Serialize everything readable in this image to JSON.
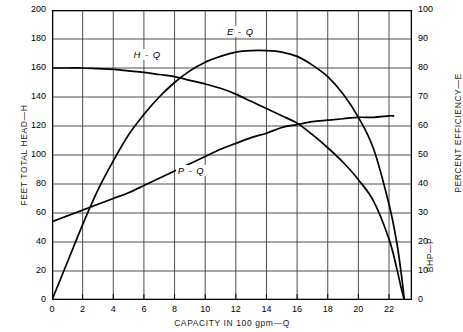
{
  "chart_data": {
    "type": "line",
    "title": "",
    "xlabel": "CAPACITY IN 100 gpm—Q",
    "ylabel_left": "FEET TOTAL HEAD—H",
    "ylabel_right_top": "PERCENT EFFICIENCY—E",
    "ylabel_right_bottom": "BHP—P",
    "xlim": [
      0,
      23.5
    ],
    "ylim_left": [
      0,
      200
    ],
    "ylim_right": [
      0,
      100
    ],
    "grid": true,
    "legend": "inline-curve-labels",
    "x_ticks": [
      0,
      2,
      4,
      6,
      8,
      10,
      12,
      14,
      16,
      18,
      20,
      22
    ],
    "y_ticks_left": [
      0,
      20,
      40,
      60,
      80,
      100,
      120,
      140,
      160,
      180,
      200
    ],
    "y_ticks_right": [
      0,
      10,
      20,
      30,
      40,
      50,
      60,
      70,
      80,
      90,
      100
    ],
    "series": [
      {
        "name": "H - Q",
        "label": "H - Q",
        "axis": "left",
        "units": "feet total head",
        "x": [
          0,
          1,
          2,
          3,
          4,
          5,
          6,
          7,
          8,
          9,
          10,
          11,
          12,
          13,
          14,
          15,
          16,
          17,
          18,
          19,
          20,
          21,
          22,
          22.5,
          22.8,
          23
        ],
        "values": [
          160,
          160,
          160,
          159.5,
          159,
          158,
          157,
          155.5,
          154,
          151.5,
          149,
          146,
          142,
          137,
          132,
          127,
          122,
          114,
          105,
          95,
          83,
          68,
          42,
          22,
          8,
          0
        ]
      },
      {
        "name": "E - Q",
        "label": "E - Q",
        "axis": "right",
        "units": "percent efficiency",
        "x": [
          0,
          1,
          2,
          3,
          4,
          5,
          6,
          7,
          8,
          9,
          10,
          11,
          12,
          13,
          14,
          15,
          16,
          17,
          18,
          19,
          20,
          21,
          22,
          22.5,
          22.8,
          23
        ],
        "values": [
          0,
          13,
          26,
          38,
          48,
          57,
          64,
          70,
          75,
          79,
          82,
          84,
          85.5,
          86,
          86,
          85.5,
          84,
          81,
          77,
          71,
          63,
          52,
          33,
          20,
          9,
          0
        ]
      },
      {
        "name": "P - Q",
        "label": "P - Q",
        "axis": "right",
        "units": "brake horsepower",
        "x": [
          0,
          1,
          2,
          3,
          4,
          5,
          6,
          7,
          8,
          9,
          10,
          11,
          12,
          13,
          14,
          15,
          16,
          17,
          18,
          19,
          20,
          21,
          22,
          22.3
        ],
        "values": [
          27,
          29,
          31,
          33,
          35,
          37,
          39.5,
          42,
          44.5,
          47,
          49.5,
          52,
          54,
          56,
          57.5,
          59.5,
          60.5,
          61.5,
          62,
          62.5,
          63,
          63,
          63.5,
          63.5
        ]
      }
    ],
    "annotations": [
      {
        "text": "H - Q",
        "x": 6.1,
        "y_left": 168
      },
      {
        "text": "E - Q",
        "x": 12.2,
        "y_right": 92
      },
      {
        "text": "P - Q",
        "x": 9.0,
        "y_right": 44
      }
    ]
  },
  "colors": {
    "curve": "#000000",
    "grid": "#3a3a3a",
    "frame": "#000000",
    "background": "#ffffff"
  }
}
